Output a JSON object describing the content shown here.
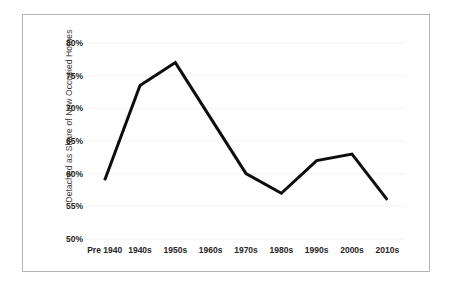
{
  "chart_data": {
    "type": "line",
    "title": "",
    "xlabel": "",
    "ylabel": "Detached as Share of New Occupied Homes",
    "categories": [
      "Pre 1940",
      "1940s",
      "1950s",
      "1960s",
      "1970s",
      "1980s",
      "1990s",
      "2000s",
      "2010s"
    ],
    "values": [
      59,
      73.5,
      77,
      68.5,
      60,
      57,
      62,
      63,
      56
    ],
    "series": [
      {
        "name": "Detached as Share of New Occupied Homes",
        "values": [
          59,
          73.5,
          77,
          68.5,
          60,
          57,
          62,
          63,
          56
        ]
      }
    ],
    "ylim": [
      50,
      80
    ],
    "ytick_values": [
      50,
      55,
      60,
      65,
      70,
      75,
      80
    ],
    "ytick_labels": [
      "50%",
      "55%",
      "60%",
      "65%",
      "70%",
      "75%",
      "80%"
    ],
    "grid": true,
    "legend": false,
    "legend_position": "none",
    "line_color": "#0d0d0d",
    "gridline_color": "#f4f4f4",
    "border_color": "#b4b4b4",
    "background_color": "#ffffff",
    "value_suffix": "%"
  }
}
